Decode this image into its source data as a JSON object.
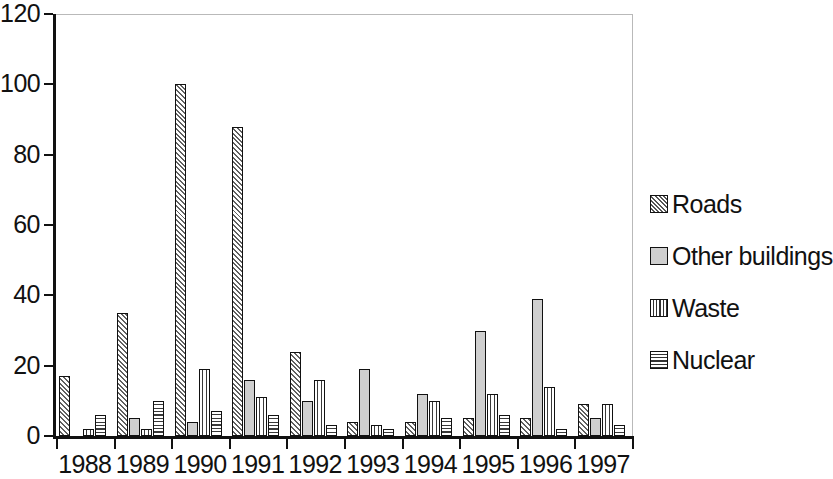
{
  "chart_data": {
    "type": "bar",
    "title": "",
    "subtitle": "",
    "xlabel": "",
    "ylabel": "",
    "xlim": [
      1988,
      1997
    ],
    "ylim": [
      0,
      120
    ],
    "ytick_labels": [
      "120",
      "100",
      "80",
      "60",
      "40",
      "20",
      "0"
    ],
    "ytick_values": [
      120,
      100,
      80,
      60,
      40,
      20,
      0
    ],
    "grid": false,
    "legend_position": "right",
    "categories": [
      "1988",
      "1989",
      "1990",
      "1991",
      "1992",
      "1993",
      "1994",
      "1995",
      "1996",
      "1997"
    ],
    "series": [
      {
        "name": "Roads",
        "pattern": "diagonal-hatch",
        "values": [
          17,
          35,
          100,
          88,
          24,
          4,
          4,
          5,
          5,
          9
        ]
      },
      {
        "name": "Other buildings",
        "pattern": "solid-gray",
        "values": [
          0,
          5,
          4,
          16,
          10,
          19,
          12,
          30,
          39,
          5
        ]
      },
      {
        "name": "Waste",
        "pattern": "vertical-lines",
        "values": [
          2,
          2,
          19,
          11,
          16,
          3,
          10,
          12,
          14,
          9
        ]
      },
      {
        "name": "Nuclear",
        "pattern": "horizontal-lines",
        "values": [
          6,
          10,
          7,
          6,
          3,
          2,
          5,
          6,
          2,
          3
        ]
      }
    ]
  },
  "axes": {
    "y_ticks": [
      {
        "label": "120",
        "value": 120
      },
      {
        "label": "100",
        "value": 100
      },
      {
        "label": "80",
        "value": 80
      },
      {
        "label": "60",
        "value": 60
      },
      {
        "label": "40",
        "value": 40
      },
      {
        "label": "20",
        "value": 20
      },
      {
        "label": "0",
        "value": 0
      }
    ],
    "x_ticks": [
      "1988",
      "1989",
      "1990",
      "1991",
      "1992",
      "1993",
      "1994",
      "1995",
      "1996",
      "1997"
    ]
  },
  "legend": {
    "items": [
      {
        "label": "Roads",
        "pattern": "diagonal-hatch",
        "swatch_icon": "hatch-swatch-icon"
      },
      {
        "label": "Other buildings",
        "pattern": "solid-gray",
        "swatch_icon": "gray-swatch-icon"
      },
      {
        "label": "Waste",
        "pattern": "vertical-lines",
        "swatch_icon": "vertical-lines-swatch-icon"
      },
      {
        "label": "Nuclear",
        "pattern": "horizontal-lines",
        "swatch_icon": "horizontal-lines-swatch-icon"
      }
    ]
  },
  "colors": {
    "axis": "#111111",
    "frame": "#b9b9b9",
    "bar_outline": "#111111",
    "bar_fill_default": "#ffffff",
    "other_buildings_fill": "#cfcfcf",
    "background": "#ffffff"
  }
}
